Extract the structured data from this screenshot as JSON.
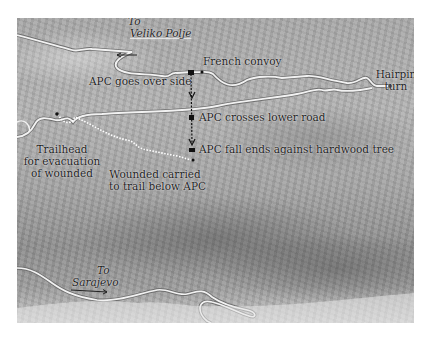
{
  "map": {
    "colors": {
      "road": "#f2f2f2",
      "road_outline": "#6f6f6f",
      "marker": "#111111",
      "trail": "#f0f0f0",
      "text": "#1e1e1e"
    },
    "destinations": {
      "north": {
        "to": "To",
        "place": "Veliko Polje"
      },
      "south": {
        "to": "To",
        "place": "Sarajevo"
      }
    },
    "labels": {
      "french_convoy": "French convoy",
      "apc_over_side": "APC goes over side",
      "apc_crosses": "APC crosses lower road",
      "apc_fall_ends": "APC fall ends against hardwood tree",
      "hairpin_line1": "Hairpin",
      "hairpin_line2": "turn",
      "trailhead_line1": "Trailhead",
      "trailhead_line2": "for evacuation",
      "trailhead_line3": "of wounded",
      "wounded_line1": "Wounded carried",
      "wounded_line2": "to trail below APC"
    },
    "icons": {
      "direction_arrow": "left-arrow / right-arrow",
      "path_arrow": "down-arrow",
      "marker": "black-square"
    }
  }
}
